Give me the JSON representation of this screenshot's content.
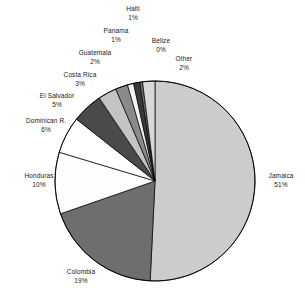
{
  "chart_data": {
    "type": "pie",
    "title": "",
    "subtitle": "",
    "xlabel": "",
    "ylabel": "",
    "legend_position": "none",
    "grid": false,
    "value_unit": "percent",
    "start_angle_deg": 0,
    "direction": "clockwise",
    "categories": [
      "Jamaica",
      "Colombia",
      "Honduras",
      "Dominican R.",
      "El Salvador",
      "Costa Rica",
      "Guatemala",
      "Panama",
      "Haiti",
      "Belize",
      "Other"
    ],
    "values": [
      51,
      19,
      10,
      6,
      5,
      3,
      2,
      1,
      1,
      0,
      2
    ],
    "slices": [
      {
        "label": "Jamaica",
        "value": 51,
        "value_text": "51%",
        "color": "#cccccc"
      },
      {
        "label": "Colombia",
        "value": 19,
        "value_text": "19%",
        "color": "#6e6e6e"
      },
      {
        "label": "Honduras",
        "value": 10,
        "value_text": "10%",
        "color": "#fdfdfd"
      },
      {
        "label": "Dominican R.",
        "value": 6,
        "value_text": "6%",
        "color": "#ffffff"
      },
      {
        "label": "El Salvador",
        "value": 5,
        "value_text": "5%",
        "color": "#4a4a4a"
      },
      {
        "label": "Costa Rica",
        "value": 3,
        "value_text": "3%",
        "color": "#c4c4c4"
      },
      {
        "label": "Guatemala",
        "value": 2,
        "value_text": "2%",
        "color": "#8a8a8a"
      },
      {
        "label": "Panama",
        "value": 1,
        "value_text": "1%",
        "color": "#f2f2f2"
      },
      {
        "label": "Haiti",
        "value": 1,
        "value_text": "1%",
        "color": "#3a3a3a"
      },
      {
        "label": "Belize",
        "value": 0,
        "value_text": "0%",
        "color": "#707070"
      },
      {
        "label": "Other",
        "value": 2,
        "value_text": "2%",
        "color": "#d8d8d8"
      }
    ],
    "colors": {
      "outline": "#000000",
      "background": "#ffffff",
      "text": "#1a1a1a"
    }
  }
}
